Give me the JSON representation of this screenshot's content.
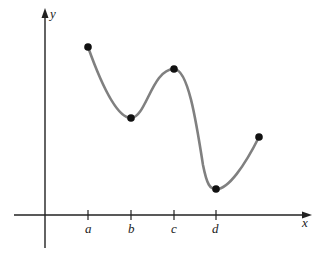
{
  "figure": {
    "axes": {
      "x_label": "x",
      "y_label": "y",
      "origin_px": [
        45,
        215
      ],
      "x_axis_px": {
        "start": 14,
        "end": 310
      },
      "y_axis_px": {
        "top": 10,
        "bottom": 248
      }
    },
    "ticks": [
      {
        "label": "a",
        "x": 88
      },
      {
        "label": "b",
        "x": 131
      },
      {
        "label": "c",
        "x": 174
      },
      {
        "label": "d",
        "x": 216
      }
    ],
    "curve": {
      "color": "#808080",
      "points_px": [
        [
          88,
          47
        ],
        [
          131,
          118
        ],
        [
          174,
          69
        ],
        [
          216,
          189
        ],
        [
          259,
          137
        ]
      ]
    },
    "markers": [
      {
        "name": "start-point",
        "x": 88,
        "y": 47
      },
      {
        "name": "local-min-b",
        "x": 131,
        "y": 118
      },
      {
        "name": "local-max-c",
        "x": 174,
        "y": 69
      },
      {
        "name": "local-min-d",
        "x": 216,
        "y": 189
      },
      {
        "name": "end-point",
        "x": 259,
        "y": 137
      }
    ]
  }
}
